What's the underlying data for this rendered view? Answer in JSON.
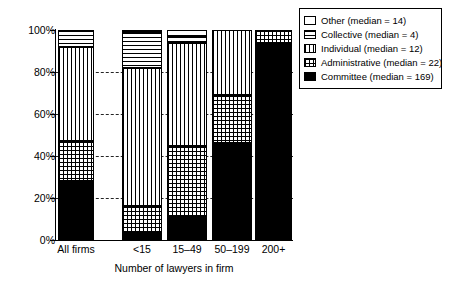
{
  "chart_data": {
    "type": "bar",
    "subtype": "stacked-percentage",
    "title": "",
    "xlabel": "Number of lawyers in firm",
    "ylabel": "",
    "categories": [
      "All firms",
      "<15",
      "15–49",
      "50–199",
      "200+"
    ],
    "ylim": [
      0,
      100
    ],
    "ytick_labels": [
      "0%",
      "20%",
      "40%",
      "60%",
      "80%",
      "100%"
    ],
    "ytick_values": [
      0,
      20,
      40,
      60,
      80,
      100
    ],
    "grid": "horizontal-dashed",
    "legend_position": "top-right",
    "stack_order_bottom_to_top": [
      "Committee",
      "Administrative",
      "Individual",
      "Collective",
      "Other"
    ],
    "series": [
      {
        "name": "Committee",
        "legend": "Committee (median = 169)",
        "median": 169,
        "pattern": "solid-black",
        "values": [
          28,
          4,
          11,
          46,
          94
        ]
      },
      {
        "name": "Administrative",
        "legend": "Administrative (median = 22)",
        "median": 22,
        "pattern": "crosshatch",
        "values": [
          19,
          12,
          34,
          23,
          6
        ]
      },
      {
        "name": "Individual",
        "legend": "Individual (median = 12)",
        "median": 12,
        "pattern": "vertical-lines",
        "values": [
          45,
          66,
          49,
          31,
          0
        ]
      },
      {
        "name": "Collective",
        "legend": "Collective (median = 4)",
        "median": 4,
        "pattern": "horizontal-lines",
        "values": [
          8,
          17,
          3,
          0,
          0
        ]
      },
      {
        "name": "Other",
        "legend": "Other (median = 14)",
        "median": 14,
        "pattern": "white-empty",
        "values": [
          0,
          1,
          3,
          0,
          0
        ]
      }
    ]
  },
  "legend": {
    "items": [
      {
        "label": "Other (median = 14)",
        "pattern": "white-empty"
      },
      {
        "label": "Collective (median = 4)",
        "pattern": "horizontal-lines"
      },
      {
        "label": "Individual (median = 12)",
        "pattern": "vertical-lines"
      },
      {
        "label": "Administrative (median = 22)",
        "pattern": "crosshatch"
      },
      {
        "label": "Committee (median = 169)",
        "pattern": "solid-black"
      }
    ]
  },
  "colors": {
    "ink": "#000000",
    "background": "#ffffff"
  }
}
